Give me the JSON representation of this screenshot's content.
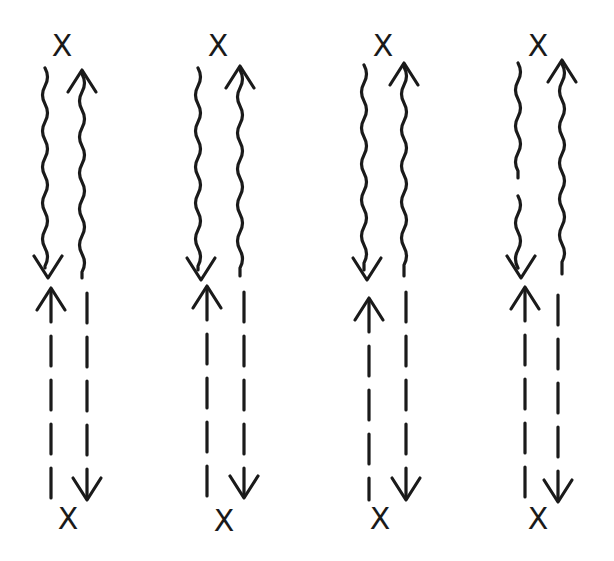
{
  "diagram": {
    "type": "hand-drawn Feynman-style diagrams",
    "background": "#ffffff",
    "ink_color": "#1a1a1a",
    "vertex_label": "X",
    "panels": [
      {
        "id": 1,
        "vertex_top": {
          "x": 62,
          "y": 45
        },
        "vertex_bottom": {
          "x": 68,
          "y": 518
        },
        "wavy_left": {
          "x": 45,
          "y1": 68,
          "y2": 278,
          "arrow": "down",
          "gap": null
        },
        "wavy_right": {
          "x": 82,
          "y1": 70,
          "y2": 278,
          "arrow": "up"
        },
        "dashed_left": {
          "x": 51,
          "y1": 288,
          "y2": 498,
          "arrow": "up"
        },
        "dashed_right": {
          "x": 87,
          "y1": 293,
          "y2": 500,
          "arrow": "down"
        }
      },
      {
        "id": 2,
        "vertex_top": {
          "x": 218,
          "y": 45
        },
        "vertex_bottom": {
          "x": 224,
          "y": 520
        },
        "wavy_left": {
          "x": 198,
          "y1": 68,
          "y2": 280,
          "arrow": "down",
          "gap": null
        },
        "wavy_right": {
          "x": 240,
          "y1": 66,
          "y2": 276,
          "arrow": "up"
        },
        "dashed_left": {
          "x": 207,
          "y1": 286,
          "y2": 496,
          "arrow": "up"
        },
        "dashed_right": {
          "x": 244,
          "y1": 292,
          "y2": 498,
          "arrow": "down"
        }
      },
      {
        "id": 3,
        "vertex_top": {
          "x": 383,
          "y": 45
        },
        "vertex_bottom": {
          "x": 380,
          "y": 518
        },
        "wavy_left": {
          "x": 364,
          "y1": 65,
          "y2": 280,
          "arrow": "down",
          "gap": null
        },
        "wavy_right": {
          "x": 404,
          "y1": 63,
          "y2": 276,
          "arrow": "up"
        },
        "dashed_left": {
          "x": 369,
          "y1": 298,
          "y2": 500,
          "arrow": "up"
        },
        "dashed_right": {
          "x": 406,
          "y1": 292,
          "y2": 500,
          "arrow": "down"
        }
      },
      {
        "id": 4,
        "vertex_top": {
          "x": 538,
          "y": 45
        },
        "vertex_bottom": {
          "x": 538,
          "y": 518
        },
        "wavy_left": {
          "x": 518,
          "y1": 63,
          "y2": 278,
          "arrow": "down",
          "gap": [
            178,
            196
          ]
        },
        "wavy_right": {
          "x": 562,
          "y1": 60,
          "y2": 274,
          "arrow": "up"
        },
        "dashed_left": {
          "x": 525,
          "y1": 287,
          "y2": 500,
          "arrow": "up"
        },
        "dashed_right": {
          "x": 558,
          "y1": 295,
          "y2": 502,
          "arrow": "down"
        }
      }
    ]
  }
}
